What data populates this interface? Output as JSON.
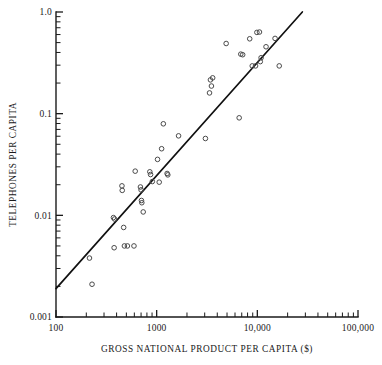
{
  "chart_data": {
    "type": "scatter",
    "title": "",
    "xlabel": "GROSS NATIONAL PRODUCT PER CAPITA ($)",
    "ylabel": "TELEPHONES PER CAPITA",
    "xscale": "log",
    "yscale": "log",
    "xlim": [
      100,
      100000
    ],
    "ylim": [
      0.001,
      1.0
    ],
    "grid": false,
    "legend": null,
    "x_tick_labels": [
      "100",
      "1000",
      "10,000",
      "100,000"
    ],
    "x_tick_values": [
      100,
      1000,
      10000,
      100000
    ],
    "y_tick_labels": [
      "1.0",
      "0.1",
      "0.01",
      "0.001"
    ],
    "y_tick_values": [
      1.0,
      0.1,
      0.01,
      0.001
    ],
    "marker": "open-circle",
    "marker_color": "#4a4a4a",
    "line_color": "#111111",
    "point_count": 45,
    "points": [
      {
        "x": 215,
        "y": 0.0038
      },
      {
        "x": 228,
        "y": 0.0021
      },
      {
        "x": 372,
        "y": 0.0095
      },
      {
        "x": 382,
        "y": 0.0092
      },
      {
        "x": 378,
        "y": 0.0048
      },
      {
        "x": 452,
        "y": 0.0195
      },
      {
        "x": 455,
        "y": 0.0176
      },
      {
        "x": 470,
        "y": 0.0076
      },
      {
        "x": 478,
        "y": 0.005
      },
      {
        "x": 512,
        "y": 0.005
      },
      {
        "x": 595,
        "y": 0.005
      },
      {
        "x": 612,
        "y": 0.0272
      },
      {
        "x": 690,
        "y": 0.019
      },
      {
        "x": 700,
        "y": 0.0178
      },
      {
        "x": 706,
        "y": 0.014
      },
      {
        "x": 712,
        "y": 0.0133
      },
      {
        "x": 735,
        "y": 0.0108
      },
      {
        "x": 855,
        "y": 0.0268
      },
      {
        "x": 870,
        "y": 0.0252
      },
      {
        "x": 905,
        "y": 0.0215
      },
      {
        "x": 1020,
        "y": 0.0355
      },
      {
        "x": 1060,
        "y": 0.0212
      },
      {
        "x": 1120,
        "y": 0.0452
      },
      {
        "x": 1165,
        "y": 0.0795
      },
      {
        "x": 1270,
        "y": 0.0258
      },
      {
        "x": 1290,
        "y": 0.025
      },
      {
        "x": 1650,
        "y": 0.0605
      },
      {
        "x": 3050,
        "y": 0.057
      },
      {
        "x": 3350,
        "y": 0.16
      },
      {
        "x": 3420,
        "y": 0.215
      },
      {
        "x": 3500,
        "y": 0.187
      },
      {
        "x": 3600,
        "y": 0.225
      },
      {
        "x": 4900,
        "y": 0.49
      },
      {
        "x": 6600,
        "y": 0.091
      },
      {
        "x": 6850,
        "y": 0.385
      },
      {
        "x": 7150,
        "y": 0.38
      },
      {
        "x": 8400,
        "y": 0.545
      },
      {
        "x": 8900,
        "y": 0.295
      },
      {
        "x": 9600,
        "y": 0.295
      },
      {
        "x": 9900,
        "y": 0.63
      },
      {
        "x": 10500,
        "y": 0.635
      },
      {
        "x": 10700,
        "y": 0.325
      },
      {
        "x": 10900,
        "y": 0.355
      },
      {
        "x": 12200,
        "y": 0.455
      },
      {
        "x": 15000,
        "y": 0.55
      },
      {
        "x": 16500,
        "y": 0.295
      }
    ],
    "fit_line": {
      "label": "regression line",
      "x_start": 100,
      "y_start": 0.0019,
      "x_end": 28000,
      "y_end": 1.0
    }
  }
}
